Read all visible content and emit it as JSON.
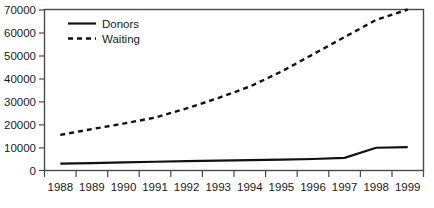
{
  "chart_data": {
    "type": "line",
    "title": "",
    "subtitle": "",
    "xlabel": "",
    "ylabel": "",
    "grid": false,
    "legend_position": "top-left",
    "categories": [
      "1988",
      "1989",
      "1990",
      "1991",
      "1992",
      "1993",
      "1994",
      "1995",
      "1996",
      "1997",
      "1998",
      "1999"
    ],
    "ylim": [
      0,
      70000
    ],
    "yticks": [
      0,
      10000,
      20000,
      30000,
      40000,
      50000,
      60000,
      70000
    ],
    "ytick_labels": [
      "0",
      "10000",
      "20000",
      "30000",
      "40000",
      "50000",
      "60000",
      "70000"
    ],
    "series": [
      {
        "name": "Donors",
        "style": "solid",
        "color": "#111111",
        "values": [
          3000,
          3200,
          3500,
          3800,
          4100,
          4300,
          4500,
          4700,
          5000,
          5500,
          9900,
          10200
        ]
      },
      {
        "name": "Waiting",
        "style": "dashed",
        "color": "#111111",
        "values": [
          15500,
          18000,
          20400,
          23000,
          27000,
          31500,
          36500,
          43000,
          50500,
          58000,
          65500,
          70000
        ]
      }
    ]
  },
  "legend": {
    "entries": [
      {
        "label": "Donors"
      },
      {
        "label": "Waiting"
      }
    ]
  },
  "axes": {
    "y_tick_labels": [
      "70000",
      "60000",
      "50000",
      "40000",
      "30000",
      "20000",
      "10000",
      "0"
    ],
    "x_tick_labels": [
      "1988",
      "1989",
      "1990",
      "1991",
      "1992",
      "1993",
      "1994",
      "1995",
      "1996",
      "1997",
      "1998",
      "1999"
    ]
  }
}
